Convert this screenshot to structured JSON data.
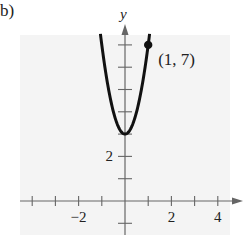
{
  "panel_label": "b)",
  "chart_data": {
    "type": "line",
    "title": "",
    "function": "y = 4x^2 + 3",
    "xlabel": "",
    "ylabel": "y",
    "xlim": [
      -4,
      5
    ],
    "ylim": [
      -1,
      7.5
    ],
    "grid": false,
    "x_ticks": [
      -4,
      -3,
      -2,
      -1,
      0,
      1,
      2,
      3,
      4
    ],
    "x_tick_labels": [
      {
        "value": -2,
        "label": "−2"
      },
      {
        "value": 2,
        "label": "2"
      },
      {
        "value": 4,
        "label": "4"
      }
    ],
    "y_ticks": [
      -1,
      1,
      2,
      3,
      4,
      5,
      6,
      7
    ],
    "y_tick_labels": [
      {
        "value": 2,
        "label": "2"
      }
    ],
    "series": [
      {
        "name": "parabola",
        "vertex": [
          0,
          3
        ],
        "x": [
          -1.05,
          -0.75,
          -0.5,
          -0.25,
          0,
          0.25,
          0.5,
          0.75,
          1,
          1.05
        ],
        "y": [
          7.41,
          5.25,
          4,
          3.25,
          3,
          3.25,
          4,
          5.25,
          7,
          7.41
        ]
      }
    ],
    "annotations": [
      {
        "point": [
          1,
          7
        ],
        "label": "(1, 7)",
        "marker": "filled-circle"
      }
    ]
  },
  "colors": {
    "background": "#f4f4f4",
    "curve": "#111111",
    "axis": "#666666"
  }
}
